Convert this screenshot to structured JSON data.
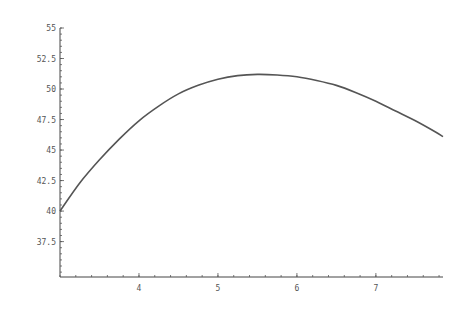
{
  "chart_data": {
    "type": "line",
    "title": "",
    "xlabel": "",
    "ylabel": "",
    "xlim": [
      3.0,
      7.85
    ],
    "ylim": [
      34.6,
      55
    ],
    "grid": false,
    "legend": "none",
    "x_ticks": [
      4,
      5,
      6,
      7
    ],
    "x_tick_labels": [
      "4",
      "5",
      "6",
      "7"
    ],
    "x_minor_step": 0.2,
    "y_ticks": [
      37.5,
      40,
      42.5,
      45,
      47.5,
      50,
      52.5,
      55
    ],
    "y_tick_labels": [
      "37.5",
      "40",
      "42.5",
      "45",
      "47.5",
      "50",
      "52.5",
      "55"
    ],
    "y_minor_step": 0.5,
    "series": [
      {
        "name": "curve",
        "color": "#555555",
        "x": [
          3.0,
          3.25,
          3.5,
          3.75,
          4.0,
          4.25,
          4.5,
          4.75,
          5.0,
          5.25,
          5.5,
          5.75,
          6.0,
          6.25,
          6.5,
          6.75,
          7.0,
          7.25,
          7.5,
          7.75,
          7.85
        ],
        "y": [
          40.0,
          42.3,
          44.2,
          45.9,
          47.4,
          48.6,
          49.6,
          50.3,
          50.8,
          51.1,
          51.2,
          51.15,
          51.0,
          50.7,
          50.3,
          49.7,
          49.0,
          48.2,
          47.4,
          46.5,
          46.1
        ]
      }
    ]
  }
}
